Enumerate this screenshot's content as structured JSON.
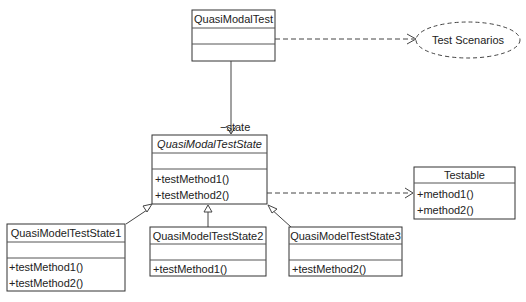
{
  "diagram": {
    "type": "UML class diagram",
    "classes": {
      "quasi_modal_test": {
        "name": "QuasiModalTest",
        "attributes": [],
        "methods": []
      },
      "quasi_modal_test_state": {
        "name": "QuasiModalTestState",
        "abstract": true,
        "attributes": [],
        "methods": [
          "+testMethod1()",
          "+testMethod2()"
        ]
      },
      "testable": {
        "name": "Testable",
        "methods": [
          "+method1()",
          "+method2()"
        ]
      },
      "state1": {
        "name": "QuasiModelTestState1",
        "attributes": [],
        "methods": [
          "+testMethod1()",
          "+testMethod2()"
        ]
      },
      "state2": {
        "name": "QuasiModelTestState2",
        "attributes": [],
        "methods": [
          "+testMethod1()"
        ]
      },
      "state3": {
        "name": "QuasiModelTestState3",
        "attributes": [],
        "methods": [
          "+testMethod2()"
        ]
      }
    },
    "use_case": {
      "name": "Test Scenarios"
    },
    "associations": {
      "state_role": "−state"
    },
    "relationships": [
      {
        "from": "QuasiModalTest",
        "to": "Test Scenarios",
        "kind": "dependency"
      },
      {
        "from": "QuasiModalTest",
        "to": "QuasiModalTestState",
        "kind": "association",
        "role": "−state"
      },
      {
        "from": "QuasiModalTestState",
        "to": "Testable",
        "kind": "dependency"
      },
      {
        "from": "QuasiModelTestState1",
        "to": "QuasiModalTestState",
        "kind": "generalization"
      },
      {
        "from": "QuasiModelTestState2",
        "to": "QuasiModalTestState",
        "kind": "generalization"
      },
      {
        "from": "QuasiModelTestState3",
        "to": "QuasiModalTestState",
        "kind": "generalization"
      }
    ]
  }
}
